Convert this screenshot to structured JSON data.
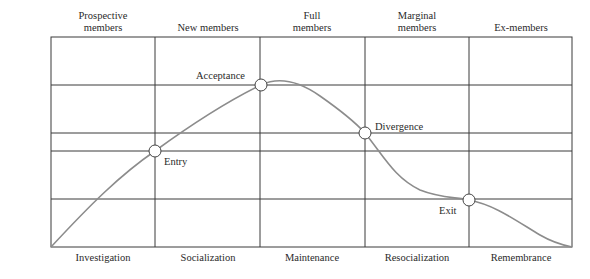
{
  "diagram": {
    "type": "group-socialization-model",
    "y_axis_label": "— Commitment —",
    "y_axis_arrow": "arrow-up",
    "phases_top": [
      {
        "label_line1": "Prospective",
        "label_line2": "members"
      },
      {
        "label_line1": "",
        "label_line2": "New members"
      },
      {
        "label_line1": "Full",
        "label_line2": "members"
      },
      {
        "label_line1": "Marginal",
        "label_line2": "members"
      },
      {
        "label_line1": "",
        "label_line2": "Ex-members"
      }
    ],
    "processes_bottom": [
      {
        "label": "Investigation"
      },
      {
        "label": "Socialization"
      },
      {
        "label": "Maintenance"
      },
      {
        "label": "Resocialization"
      },
      {
        "label": "Remembrance"
      }
    ],
    "transition_points": [
      {
        "label": "Entry"
      },
      {
        "label": "Acceptance"
      },
      {
        "label": "Divergence"
      },
      {
        "label": "Exit"
      }
    ],
    "colors": {
      "grid": "#3a3a3a",
      "curve": "#8c8c8c",
      "marker_fill": "#ffffff",
      "marker_stroke": "#444444",
      "text": "#2a2a2a"
    }
  }
}
